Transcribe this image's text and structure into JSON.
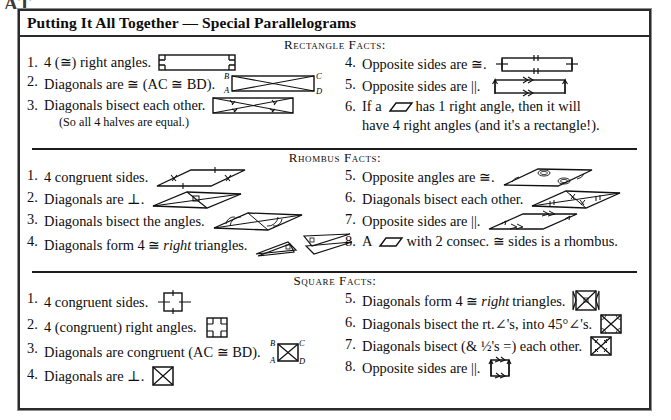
{
  "page": {
    "artifact_text": "AT",
    "title": "Putting It All Together — Special Parallelograms",
    "border_color": "#2b2b2b",
    "ink_color": "#0d0d0d",
    "background": "#ffffff"
  },
  "sections": [
    {
      "id": "rectangle",
      "heading": "Rectangle Facts:",
      "left": [
        {
          "num": "1.",
          "text": "4 (≅) right angles.",
          "figure": "rectangle-right-angles",
          "sub": null
        },
        {
          "num": "2.",
          "text": "Diagonals are ≅ (AC ≅ BD).",
          "figure": "rectangle-diagonals-labeled",
          "sub": null
        },
        {
          "num": "3.",
          "text": "Diagonals bisect each other.",
          "figure": "rectangle-diagonals-bisect",
          "sub": "(So all 4 halves are equal.)"
        }
      ],
      "right": [
        {
          "num": "4.",
          "text": "Opposite sides are ≅.",
          "figure": "rectangle-opposite-congruent",
          "sub": null
        },
        {
          "num": "5.",
          "text": "Opposite sides are ||.",
          "figure": "rectangle-opposite-parallel",
          "sub": null
        },
        {
          "num": "6.",
          "text_before": "If a",
          "text_after": "has 1 right angle, then it will",
          "line2": "have 4 right angles (and it's a rectangle!).",
          "figure": "parallelogram-glyph",
          "sub": null
        }
      ]
    },
    {
      "id": "rhombus",
      "heading": "Rhombus Facts:",
      "left": [
        {
          "num": "1.",
          "text": "4 congruent sides.",
          "figure": "rhombus-congruent-sides",
          "sub": null
        },
        {
          "num": "2.",
          "text": "Diagonals are ⊥.",
          "figure": "rhombus-perp-diagonals",
          "sub": null
        },
        {
          "num": "3.",
          "text": "Diagonals bisect the angles.",
          "figure": "rhombus-bisect-angles",
          "sub": null
        },
        {
          "num": "4.",
          "text_plain": "Diagonals form 4 ≅ ",
          "text_italic": "right",
          "text_tail": " triangles.",
          "figure": "rhombus-four-right-triangles",
          "sub": null
        }
      ],
      "right": [
        {
          "num": "5.",
          "text": "Opposite angles are ≅.",
          "figure": "rhombus-opposite-angles",
          "sub": null
        },
        {
          "num": "6.",
          "text": "Diagonals bisect each other.",
          "figure": "rhombus-diagonals-bisect",
          "sub": null
        },
        {
          "num": "7.",
          "text": "Opposite sides are ||.",
          "figure": "rhombus-opposite-parallel",
          "sub": null
        },
        {
          "num": "8.",
          "text_before": "A",
          "text_after": "with 2 consec. ≅ sides is a rhombus.",
          "figure": "parallelogram-glyph",
          "sub": null
        }
      ]
    },
    {
      "id": "square",
      "heading": "Square Facts:",
      "left": [
        {
          "num": "1.",
          "text": "4 congruent sides.",
          "figure": "square-congruent-sides",
          "sub": null
        },
        {
          "num": "2.",
          "text": "4 (congruent) right angles.",
          "figure": "square-right-angles",
          "sub": null
        },
        {
          "num": "3.",
          "text": "Diagonals are congruent (AC ≅ BD).",
          "figure": "square-diagonals-labeled",
          "sub": null
        },
        {
          "num": "4.",
          "text": "Diagonals are ⊥.",
          "figure": "square-perp-diagonals",
          "sub": null
        }
      ],
      "right": [
        {
          "num": "5.",
          "text_plain": "Diagonals form 4 ≅ ",
          "text_italic": "right",
          "text_tail": " triangles.",
          "figure": "square-four-right-triangles",
          "sub": null
        },
        {
          "num": "6.",
          "text": "Diagonals bisect the rt.∠'s, into 45°∠'s.",
          "figure": "square-bisect-45",
          "sub": null
        },
        {
          "num": "7.",
          "text": "Diagonals bisect (& ½'s =) each other.",
          "figure": "square-diagonals-bisect",
          "sub": null
        },
        {
          "num": "8.",
          "text": "Opposite sides are ||.",
          "figure": "square-opposite-parallel",
          "sub": null
        }
      ]
    }
  ],
  "vertex_labels": {
    "a": "A",
    "b": "B",
    "c": "C",
    "d": "D"
  },
  "symbols": {
    "congruent": "≅",
    "perpendicular": "⊥",
    "parallel": "||",
    "angle": "∠",
    "parallelogram": "▱"
  }
}
